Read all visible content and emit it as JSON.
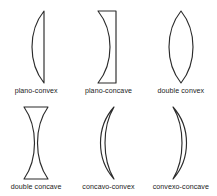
{
  "figure": {
    "background_color": "#ffffff",
    "stroke_color": "#2b2b2b",
    "rows": 2,
    "columns": 3
  },
  "lenses": [
    {
      "id": "plano-convex",
      "label": "plano-convex",
      "left_surface": "convex",
      "right_surface": "plano",
      "shape_name": "plano-convex-lens-shape",
      "path": "M 22 2 C 6 22, 6 54, 22 74 L 22 2 Z"
    },
    {
      "id": "plano-concave",
      "label": "plano-concave",
      "left_surface": "concave",
      "right_surface": "plano",
      "shape_name": "plano-concave-lens-shape",
      "path": "M 4 2 L 22 2 L 22 74 L 4 74 C 20 54, 20 22, 4 2 Z"
    },
    {
      "id": "double-convex",
      "label": "double convex",
      "left_surface": "convex",
      "right_surface": "convex",
      "shape_name": "double-convex-lens-shape",
      "path": "M 14 2 C 30 22, 30 54, 14 74 C -2 54, -2 22, 14 2 Z"
    },
    {
      "id": "double-concave",
      "label": "double concave",
      "left_surface": "concave",
      "right_surface": "concave",
      "shape_name": "double-concave-lens-shape",
      "path": "M 2 2 L 26 2 C 12 22, 12 54, 26 74 L 2 74 C 16 54, 16 22, 2 2 Z"
    },
    {
      "id": "concavo-convex",
      "label": "concavo-convex",
      "left_surface": "convex",
      "right_surface": "concave",
      "shape_name": "concavo-convex-meniscus-shape",
      "path": "M 20 2 C 2 22, 2 54, 20 74 C 8 54, 8 22, 20 2 Z"
    },
    {
      "id": "convexo-concave",
      "label": "convexo-concave",
      "left_surface": "concave",
      "right_surface": "convex",
      "shape_name": "convexo-concave-meniscus-shape",
      "path": "M 6 2 C 24 22, 24 54, 6 74 C 18 54, 18 22, 6 2 Z"
    }
  ]
}
